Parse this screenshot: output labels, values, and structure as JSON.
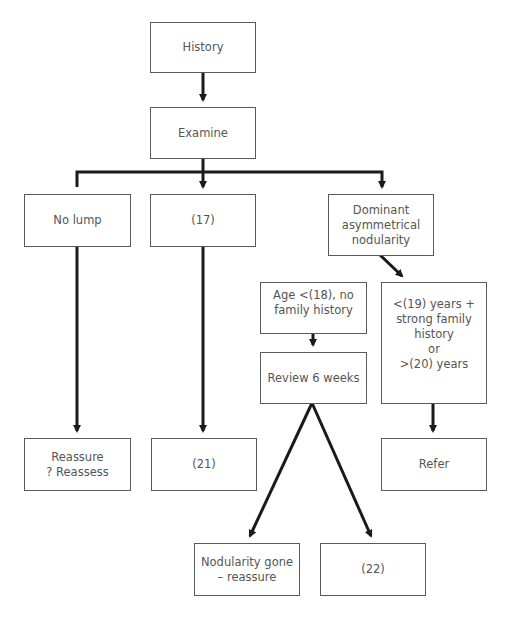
{
  "nodes": {
    "history": "History",
    "examine": "Examine",
    "no_lump": "No lump",
    "n17": "(17)",
    "dominant": "Dominant\nasymmetrical\nnodularity",
    "age": "Age <(18), no\nfamily history",
    "risk": "<(19) years +\nstrong family\nhistory\nor\n>(20) years",
    "review": "Review 6 weeks",
    "reassure": "Reassure\n? Reassess",
    "n21": "(21)",
    "refer": "Refer",
    "gone": "Nodularity gone\n– reassure",
    "n22": "(22)"
  },
  "colors": {
    "line": "#1a1a1a",
    "border": "#5a5a5a",
    "text": "#555555"
  }
}
